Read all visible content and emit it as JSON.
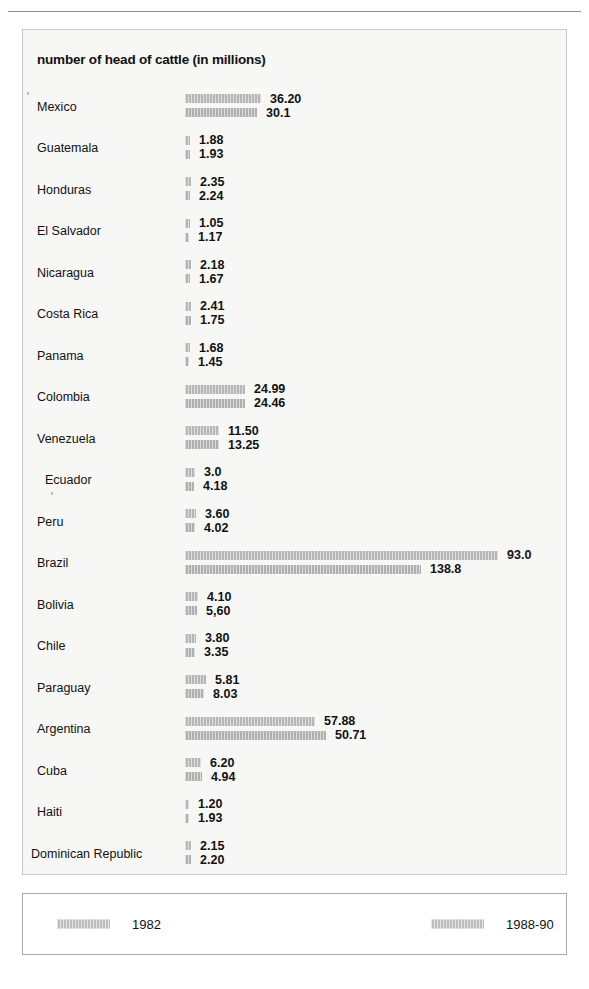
{
  "chart_title": "number of head of cattle (in millions)",
  "legend": {
    "series1_label": "1982",
    "series2_label": "1988-90"
  },
  "chart_data": {
    "type": "bar",
    "orientation": "horizontal",
    "grouped": true,
    "title": "number of head of cattle (in millions)",
    "xlabel": "",
    "ylabel": "",
    "unit": "millions of head",
    "grid": false,
    "legend_position": "bottom",
    "categories": [
      "Mexico",
      "Guatemala",
      "Honduras",
      "El Salvador",
      "Nicaragua",
      "Costa Rica",
      "Panama",
      "Colombia",
      "Venezuela",
      "Ecuador",
      "Peru",
      "Brazil",
      "Bolivia",
      "Chile",
      "Paraguay",
      "Argentina",
      "Cuba",
      "Haiti",
      "Dominican Republic"
    ],
    "series": [
      {
        "name": "1982",
        "labels": [
          "36.20",
          "1.88",
          "2.35",
          "1.05",
          "2.18",
          "2.41",
          "1.68",
          "24.99",
          "11.50",
          "3.0",
          "3.60",
          "93.0",
          "4.10",
          "3.80",
          "5.81",
          "57.88",
          "6.20",
          "1.20",
          "2.15"
        ],
        "values": [
          36.2,
          1.88,
          2.35,
          1.05,
          2.18,
          2.41,
          1.68,
          24.99,
          11.5,
          3.0,
          3.6,
          93.0,
          4.1,
          3.8,
          5.81,
          57.88,
          6.2,
          1.2,
          2.15
        ],
        "bar_px": [
          76,
          5,
          6,
          5,
          6,
          6,
          5,
          60,
          34,
          10,
          11,
          313,
          13,
          11,
          21,
          130,
          16,
          4,
          6
        ]
      },
      {
        "name": "1988-90",
        "labels": [
          "30.1",
          "1.93",
          "2.24",
          "1.17",
          "1.67",
          "1.75",
          "1.45",
          "24.46",
          "13.25",
          "4.18",
          "4.02",
          "138.8",
          "5,60",
          "3.35",
          "8.03",
          "50.71",
          "4.94",
          "1.93",
          "2.20"
        ],
        "values": [
          30.1,
          1.93,
          2.24,
          1.17,
          1.67,
          1.75,
          1.45,
          24.46,
          13.25,
          4.18,
          4.02,
          138.8,
          5.6,
          3.35,
          8.03,
          50.71,
          4.94,
          1.93,
          2.2
        ],
        "bar_px": [
          72,
          5,
          5,
          4,
          5,
          6,
          4,
          60,
          34,
          9,
          10,
          236,
          12,
          10,
          19,
          141,
          17,
          4,
          6
        ]
      }
    ]
  }
}
